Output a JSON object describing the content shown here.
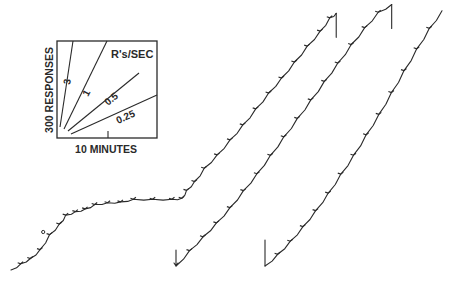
{
  "chart_data": {
    "type": "line",
    "title": "",
    "xlabel": "10 MINUTES",
    "ylabel": "300 RESPONSES",
    "grid": false,
    "legend": {
      "placement": "top-left",
      "title": "R's/SEC",
      "rates": [
        {
          "label": "3",
          "value": 3
        },
        {
          "label": "1",
          "value": 1
        },
        {
          "label": "0.5",
          "value": 0.5
        },
        {
          "label": "0.25",
          "value": 0.25
        }
      ]
    },
    "units": {
      "x": "minutes",
      "y": "responses"
    },
    "scale": {
      "x_minutes_per_unit": 10,
      "y_responses_per_unit": 300
    },
    "series": [
      {
        "name": "record-1",
        "x": [
          0,
          3,
          6,
          9,
          12,
          15,
          17,
          20,
          23,
          26,
          30,
          34,
          38,
          44,
          50,
          53,
          54.5,
          57,
          60,
          64,
          68,
          72,
          76,
          80,
          84,
          88,
          92,
          96,
          99,
          101
        ],
        "y": [
          0,
          70,
          130,
          230,
          400,
          520,
          620,
          660,
          690,
          740,
          760,
          770,
          800,
          800,
          800,
          810,
          900,
          1000,
          1150,
          1300,
          1470,
          1640,
          1820,
          2000,
          2170,
          2350,
          2530,
          2700,
          2850,
          2900
        ],
        "reset_at_end": true
      },
      {
        "name": "record-2",
        "x": [
          0,
          4,
          8,
          12,
          16,
          20,
          24,
          28,
          32,
          36,
          40,
          44,
          48,
          52,
          56,
          60,
          64
        ],
        "y": [
          0,
          200,
          380,
          560,
          760,
          980,
          1200,
          1440,
          1680,
          1920,
          2160,
          2400,
          2640,
          2880,
          3100,
          3300,
          3400
        ],
        "reset_at_end": true
      },
      {
        "name": "record-3",
        "x": [
          0,
          4,
          8,
          12,
          16,
          20,
          24,
          28,
          32,
          36,
          40,
          44,
          48,
          52,
          56
        ],
        "y": [
          0,
          160,
          340,
          540,
          760,
          1000,
          1260,
          1520,
          1800,
          2080,
          2380,
          2680,
          2980,
          3260,
          3500
        ],
        "reset_at_start": true
      }
    ],
    "annotations": [
      {
        "type": "circle-marker",
        "series": "record-1",
        "near_x": 10
      }
    ]
  }
}
